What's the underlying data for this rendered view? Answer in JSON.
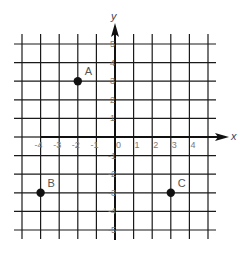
{
  "chart_data": {
    "type": "scatter",
    "title": "",
    "xlabel": "x",
    "ylabel": "y",
    "xlim": [
      -5,
      5
    ],
    "ylim": [
      -5,
      5
    ],
    "grid": true,
    "x_tick_labels": [
      "-4",
      "-3",
      "-2",
      "-1",
      "0",
      "1",
      "2",
      "3",
      "4"
    ],
    "y_tick_labels": [
      "5",
      "4",
      "3",
      "2",
      "1",
      "-1",
      "-2",
      "-3",
      "-4",
      "-5"
    ],
    "points": [
      {
        "label": "A",
        "x": -2,
        "y": 3
      },
      {
        "label": "B",
        "x": -4,
        "y": -3
      },
      {
        "label": "C",
        "x": 3,
        "y": -3
      }
    ]
  },
  "colors": {
    "grid": "#1a1a1a",
    "point": "#111111",
    "tick_text": "#7a7a7a",
    "background": "#ffffff"
  }
}
